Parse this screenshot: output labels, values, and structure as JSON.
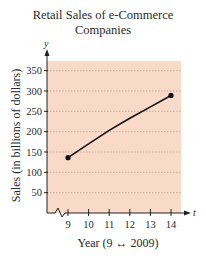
{
  "chart_data": {
    "type": "line",
    "title": "Retail Sales of e-Commerce Companies",
    "title_lines": [
      "Retail Sales of e-Commerce",
      "Companies"
    ],
    "xlabel": "Year (9 ↔ 2009)",
    "ylabel": "Sales (in billions of dollars)",
    "x_axis_variable": "t",
    "y_axis_variable": "y",
    "x_ticks": [
      9,
      10,
      11,
      12,
      13,
      14
    ],
    "y_ticks": [
      50,
      100,
      150,
      200,
      250,
      300,
      350
    ],
    "xlim": [
      8,
      14.5
    ],
    "ylim": [
      0,
      375
    ],
    "grid": "horizontal dashed",
    "axis_break": "x-axis break between 0 and 9",
    "series": [
      {
        "name": "Sales",
        "x": [
          9,
          10,
          11,
          12,
          13,
          14
        ],
        "values": [
          136,
          170,
          203,
          233,
          261,
          289
        ],
        "endpoints_marked": true
      }
    ],
    "colors": {
      "plot_background": "#f9d9c8",
      "curve": "#111111",
      "grid": "#b89a8c",
      "axis": "#222222"
    }
  }
}
